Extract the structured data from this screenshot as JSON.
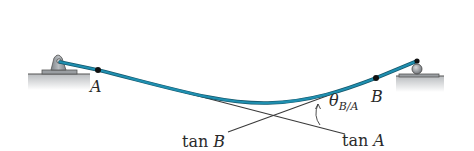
{
  "diagram": {
    "type": "beam-deflection-tangent",
    "points": [
      {
        "id": "A",
        "label": "A"
      },
      {
        "id": "B",
        "label": "B"
      }
    ],
    "tangent_labels": {
      "tan_a": "tan A",
      "tan_b": "tan B"
    },
    "angle_label": {
      "theta": "θ",
      "subscript": "B/A"
    },
    "supports": {
      "left": "pin",
      "right": "roller"
    },
    "colors": {
      "beam": "#1f8fb0",
      "beam_dark": "#15576b",
      "tangent_line": "#3a3a3a",
      "support": "#9a9ea2",
      "ground": "#c9cbcd"
    }
  }
}
